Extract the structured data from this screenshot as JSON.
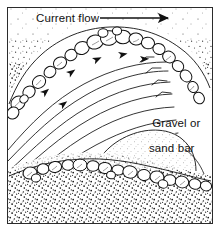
{
  "figure": {
    "type": "pen-and-ink geological cross-section diagram",
    "frame_color": "#2b2b2b",
    "background_color": "#ffffff",
    "ink_color": "#111111"
  },
  "labels": {
    "current_flow": "Current flow",
    "bar_line_1": "Gravel or",
    "bar_line_2": "sand bar"
  },
  "icons": {
    "flow_arrow": "right-arrow-icon",
    "streamline_arrowheads": "arrowhead-icon"
  },
  "diagram_data": {
    "type": "diagram",
    "flow_direction": "left-to-right",
    "elements": [
      {
        "name": "current-flow-arrow",
        "description": "horizontal line with solid triangular arrowhead pointing right",
        "x_start": 100,
        "x_end": 170,
        "y": 18
      },
      {
        "name": "upper-bank",
        "description": "arcing bank crest of outlined cobbles with dense stipple above",
        "cobble_count": 22
      },
      {
        "name": "streamlines",
        "description": "long sweeping curved flow lines fanning across the channel, some with small step kinks and arrowheads",
        "line_count": 9,
        "arrowhead_count": 6
      },
      {
        "name": "gravel-or-sand-bar",
        "description": "lightly stippled mound in lower right of channel",
        "stipple_density": "light"
      },
      {
        "name": "lower-bank",
        "description": "row of outlined cobbles along a curved edge with dense stipple below",
        "cobble_count": 18
      }
    ]
  }
}
